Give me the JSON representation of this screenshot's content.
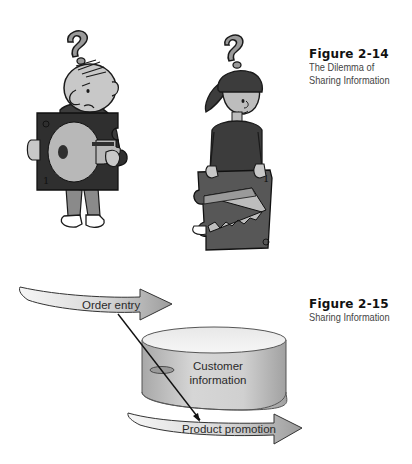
{
  "figures": [
    {
      "number": "Figure 2-14",
      "title_lines": [
        "The Dilemma of",
        "Sharing Information"
      ]
    },
    {
      "number": "Figure 2-15",
      "title_lines": [
        "Sharing Information"
      ]
    }
  ],
  "illustration_14": {
    "left_character": {
      "question_mark": "?",
      "holding": "key puzzle piece",
      "piece_number": "1"
    },
    "right_character": {
      "question_mark": "?",
      "holding": "saw puzzle piece",
      "piece_number": "1"
    }
  },
  "diagram_15": {
    "arrows": [
      {
        "label": "Order entry"
      },
      {
        "label": "Product promotion"
      }
    ],
    "database": {
      "label_lines": [
        "Customer",
        "information"
      ]
    }
  },
  "colors": {
    "outline": "#1a1a1a",
    "dark_fill": "#3c3c3c",
    "mid_fill": "#8a8a8a",
    "light_fill": "#c8c8c8",
    "arrow_light": "#f2f2f2",
    "arrow_dark": "#9a9a9a"
  }
}
